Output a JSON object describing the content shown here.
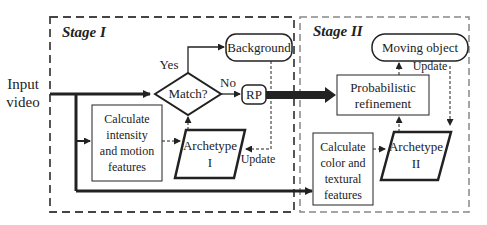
{
  "diagram": {
    "stages": [
      {
        "id": "stage1",
        "title": "Stage I"
      },
      {
        "id": "stage2",
        "title": "Stage II"
      }
    ],
    "input": {
      "line1": "Input",
      "line2": "video"
    },
    "decision": {
      "label": "Match?",
      "yes": "Yes",
      "no": "No"
    },
    "background": {
      "label": "Background"
    },
    "rp": {
      "label": "RP"
    },
    "calc1": {
      "line1": "Calculate",
      "line2": "intensity",
      "line3": "and motion",
      "line4": "features"
    },
    "archetype1": {
      "line1": "Archetype",
      "line2": "I"
    },
    "update1": "Update",
    "refinement": {
      "line1": "Probabilistic",
      "line2": "refinement"
    },
    "moving_object": {
      "label": "Moving object"
    },
    "update2": "Update",
    "calc2": {
      "line1": "Calculate",
      "line2": "color and",
      "line3": "textural",
      "line4": "features"
    },
    "archetype2": {
      "line1": "Archetype",
      "line2": "II"
    },
    "colors": {
      "line": "#222222",
      "stage1_border": "#444444",
      "stage2_border": "#888888"
    }
  }
}
